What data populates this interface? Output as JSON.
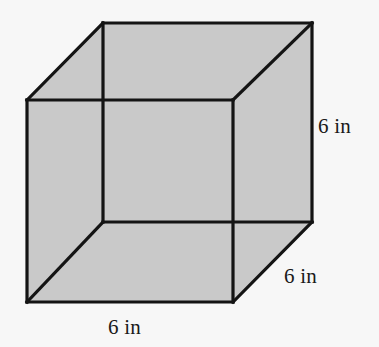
{
  "figure": {
    "kind": "geometry-diagram",
    "shape_name": "cube",
    "background_color": "#f7f7f7",
    "face_fill_color": "#c9c9c9",
    "edge_color": "#141414",
    "edge_width_px": 3.2,
    "labels": {
      "height": "6 in",
      "depth": "6 in",
      "width": "6 in"
    },
    "geometry": {
      "front_face": {
        "top_left": [
          27,
          100
        ],
        "top_right": [
          233,
          100
        ],
        "bottom_right": [
          233,
          302
        ],
        "bottom_left": [
          27,
          302
        ]
      },
      "back_face": {
        "top_left": [
          103,
          23
        ],
        "top_right": [
          312,
          23
        ],
        "bottom_right": [
          312,
          222
        ],
        "bottom_left": [
          103,
          222
        ]
      }
    }
  }
}
